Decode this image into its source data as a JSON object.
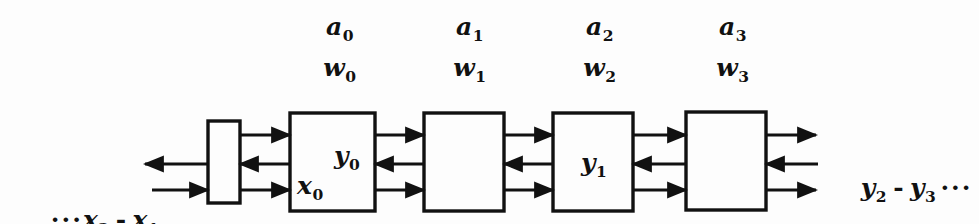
{
  "figure": {
    "background_color": "#fdfdfd",
    "ink_color": "#111111"
  },
  "coefficient_labels": [
    {
      "a": "a",
      "a_sub": "0",
      "w": "w",
      "w_sub": "0",
      "x": 340
    },
    {
      "a": "a",
      "a_sub": "1",
      "w": "w",
      "w_sub": "1",
      "x": 470
    },
    {
      "a": "a",
      "a_sub": "2",
      "w": "w",
      "w_sub": "2",
      "x": 600
    },
    {
      "a": "a",
      "a_sub": "3",
      "w": "w",
      "w_sub": "3",
      "x": 733
    }
  ],
  "blocks": [
    {
      "name": "delay-block",
      "label": "",
      "label_sub": "",
      "x": 208,
      "y": 121,
      "w": 32,
      "h": 82
    },
    {
      "name": "stage-0-block",
      "x": 290,
      "y": 113,
      "w": 85,
      "h": 98,
      "inner_labels": [
        {
          "text": "y",
          "sub": "0",
          "x": 60,
          "y": 36
        },
        {
          "text": "x",
          "sub": "0",
          "x": 10,
          "y": 64
        }
      ]
    },
    {
      "name": "stage-1-block",
      "x": 424,
      "y": 113,
      "w": 80,
      "h": 98,
      "inner_labels": []
    },
    {
      "name": "stage-2-block",
      "x": 553,
      "y": 113,
      "w": 80,
      "h": 98,
      "inner_labels": [
        {
          "text": "y",
          "sub": "1",
          "x": 30,
          "y": 44
        }
      ]
    },
    {
      "name": "stage-3-block",
      "x": 686,
      "y": 112,
      "w": 80,
      "h": 98,
      "inner_labels": []
    }
  ],
  "edge_labels": {
    "left_input": {
      "lead_dots": "···",
      "first": "x",
      "first_sub": "2",
      "dash": "-",
      "second": "x",
      "second_sub": "1",
      "x": 14,
      "y": 200
    },
    "right_output": {
      "first": "y",
      "first_sub": "2",
      "dash": "-",
      "second": "y",
      "second_sub": "3",
      "trail_dots": "···",
      "x": 824,
      "y": 175
    }
  },
  "signal_rows": {
    "top_y": 135,
    "middle_y": 164,
    "bottom_y": 190,
    "top_direction": "right",
    "middle_direction": "left",
    "bottom_direction": "right"
  }
}
